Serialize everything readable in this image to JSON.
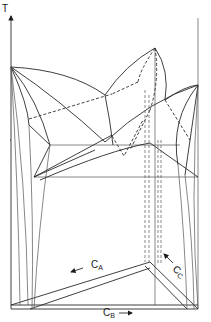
{
  "figure": {
    "type": "ternary-eutectic-space-model",
    "axes": {
      "vertical_label": "T",
      "component_labels": [
        {
          "main": "C",
          "sub": "A"
        },
        {
          "main": "C",
          "sub": "B"
        },
        {
          "main": "C",
          "sub": "C"
        }
      ]
    },
    "colors": {
      "line": "#2a2a2a",
      "background": "#ffffff"
    }
  }
}
